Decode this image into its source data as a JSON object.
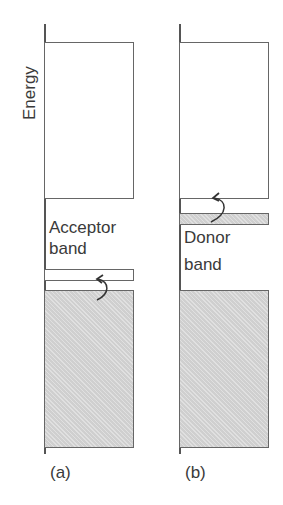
{
  "axis_label": "Energy",
  "panels": [
    {
      "id": "a",
      "caption": "(a)",
      "band_label_line1": "Acceptor",
      "band_label_line2": "band",
      "band_type": "acceptor",
      "arrow": "electron excited from valence band up into acceptor band"
    },
    {
      "id": "b",
      "caption": "(b)",
      "band_label_line1": "Donor",
      "band_label_line2": "band",
      "band_type": "donor",
      "arrow": "electron excited from donor band up into conduction band"
    }
  ],
  "colors": {
    "line": "#666666",
    "filled_band": "#d6d6d6",
    "text": "#3a3a3a"
  }
}
